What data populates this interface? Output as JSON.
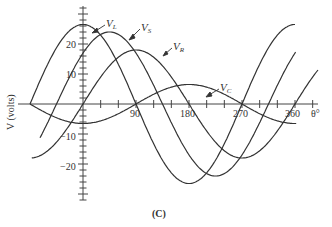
{
  "chart_data": {
    "type": "line",
    "title": "",
    "caption": "(C)",
    "xlabel": "θ°",
    "ylabel": "V  (volts)",
    "x_ticks": [
      90,
      180,
      270,
      360
    ],
    "y_ticks": [
      20,
      10,
      -10,
      -20
    ],
    "xlim": [
      -90,
      400
    ],
    "ylim": [
      -33,
      33
    ],
    "grid": false,
    "legend": "inline labels with arrows",
    "series": [
      {
        "name": "V_L",
        "label": "V",
        "sub": "L",
        "amplitude": 26.5,
        "phase_deg": 90,
        "x_range": [
          -90,
          360
        ]
      },
      {
        "name": "V_S",
        "label": "V",
        "sub": "S",
        "amplitude": 24,
        "phase_deg": 45,
        "x_range": [
          -73,
          362
        ]
      },
      {
        "name": "V_R",
        "label": "V",
        "sub": "R",
        "amplitude": 18,
        "phase_deg": 0,
        "x_range": [
          -87,
          400
        ]
      },
      {
        "name": "V_C",
        "label": "V",
        "sub": "C",
        "amplitude": 6.5,
        "phase_deg": -90,
        "x_range": [
          -90,
          362
        ]
      }
    ]
  },
  "labels": {
    "x_ticks": [
      "90",
      "180",
      "270",
      "360"
    ],
    "y_ticks": [
      "20",
      "10",
      "−10",
      "−20"
    ],
    "theta": "θ°",
    "ylabel": "V  (volts)",
    "caption": "(C)",
    "vl": "V",
    "vl_sub": "L",
    "vs": "V",
    "vs_sub": "S",
    "vr": "V",
    "vr_sub": "R",
    "vc": "V",
    "vc_sub": "C"
  }
}
